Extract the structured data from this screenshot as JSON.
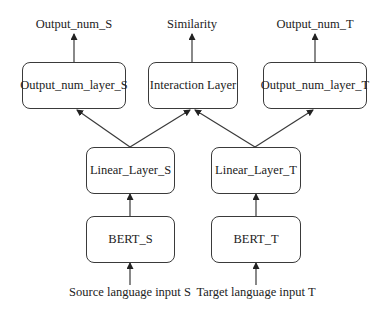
{
  "diagram": {
    "outputs": {
      "source": "Output_num_S",
      "similarity": "Similarity",
      "target": "Output_num_T"
    },
    "top_layer": {
      "source": "Output_num_layer_S",
      "interaction": "Interaction Layer",
      "target": "Output_num_layer_T"
    },
    "linear_layer": {
      "source": "Linear_Layer_S",
      "target": "Linear_Layer_T"
    },
    "encoder": {
      "source": "BERT_S",
      "target": "BERT_T"
    },
    "inputs": {
      "source": "Source language input S",
      "target": "Target language input T"
    },
    "edges": [
      {
        "from": "Source language input S",
        "to": "BERT_S"
      },
      {
        "from": "Target language input T",
        "to": "BERT_T"
      },
      {
        "from": "BERT_S",
        "to": "Linear_Layer_S"
      },
      {
        "from": "BERT_T",
        "to": "Linear_Layer_T"
      },
      {
        "from": "Linear_Layer_S",
        "to": "Output_num_layer_S"
      },
      {
        "from": "Linear_Layer_S",
        "to": "Interaction Layer"
      },
      {
        "from": "Linear_Layer_T",
        "to": "Interaction Layer"
      },
      {
        "from": "Linear_Layer_T",
        "to": "Output_num_layer_T"
      },
      {
        "from": "Output_num_layer_S",
        "to": "Output_num_S"
      },
      {
        "from": "Interaction Layer",
        "to": "Similarity"
      },
      {
        "from": "Output_num_layer_T",
        "to": "Output_num_T"
      }
    ],
    "colors": {
      "line": "#3a3a3a",
      "background": "#ffffff"
    }
  }
}
